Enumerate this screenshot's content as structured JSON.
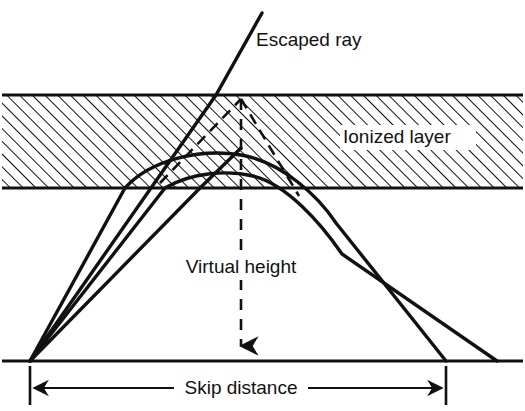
{
  "figure": {
    "background_color": "#ffffff",
    "ink_color": "#111111",
    "width": 525,
    "height": 411
  },
  "labels": {
    "escaped_ray": "Escaped ray",
    "ionized_layer": "Ionized layer",
    "virtual_height": "Virtual height",
    "skip_distance": "Skip distance"
  },
  "layer": {
    "name": "ionized-layer",
    "top_y": 95,
    "bottom_y": 188,
    "hatch_angle_deg": 45,
    "hatch_spacing": 9,
    "fill": "none",
    "stroke": "#111111"
  },
  "ground": {
    "name": "ground-line",
    "y": 361,
    "x_start": 2,
    "x_end": 523
  },
  "transmitter": {
    "name": "transmitter-point",
    "x": 30,
    "y": 361
  },
  "virtual_apex": {
    "name": "virtual-reflection-apex",
    "x": 241,
    "y": 99
  },
  "rays": [
    {
      "name": "escaped-ray",
      "type": "escaped",
      "description": "Ray that penetrates the ionized layer and escapes into space",
      "path": "M30,361 L216,95 L262,13"
    },
    {
      "name": "refracted-ray-outer",
      "type": "refracted",
      "description": "Ray refracted through the layer returning to ground at the skip distance",
      "path": "M30,361 L125,188 C150,160 200,148 241,155 C282,162 318,196 336,223 L446,361"
    },
    {
      "name": "refracted-ray-inner",
      "type": "refracted",
      "description": "Ray refracted lower in the layer returning to ground beyond the skip distance",
      "path": "M30,361 L165,188 C192,172 228,170 253,176 C286,184 320,222 342,254 L497,361"
    },
    {
      "name": "ground-ray-right",
      "type": "direct",
      "description": "Straight ray segment from transmitter up toward the apex region",
      "path": "M30,361 L200,188 L241,148"
    }
  ],
  "virtual_paths": [
    {
      "name": "virtual-path-up",
      "style": "dashed",
      "path": "M160,183 L241,99"
    },
    {
      "name": "virtual-path-down",
      "style": "dashed",
      "path": "M241,99 L299,196"
    },
    {
      "name": "virtual-height-line",
      "style": "dashed",
      "path": "M241,99 L241,352",
      "arrow": "down",
      "arrow_y": 361
    }
  ],
  "dimension": {
    "name": "skip-distance-dimension",
    "y": 388,
    "x_start": 30,
    "x_end": 446,
    "tick_top": 366,
    "tick_bottom": 405,
    "arrow_style": "inward"
  },
  "label_positions": {
    "escaped_ray": {
      "x": 256,
      "y": 41,
      "anchor": "start"
    },
    "ionized_layer": {
      "x": 343,
      "y": 137,
      "anchor": "start",
      "plate_w": 132,
      "plate_h": 24
    },
    "virtual_height": {
      "x": 241,
      "y": 267,
      "anchor": "middle",
      "plate_w": 136,
      "plate_h": 24
    },
    "skip_distance": {
      "x": 241,
      "y": 388,
      "anchor": "middle",
      "plate_w": 132,
      "plate_h": 24
    }
  }
}
